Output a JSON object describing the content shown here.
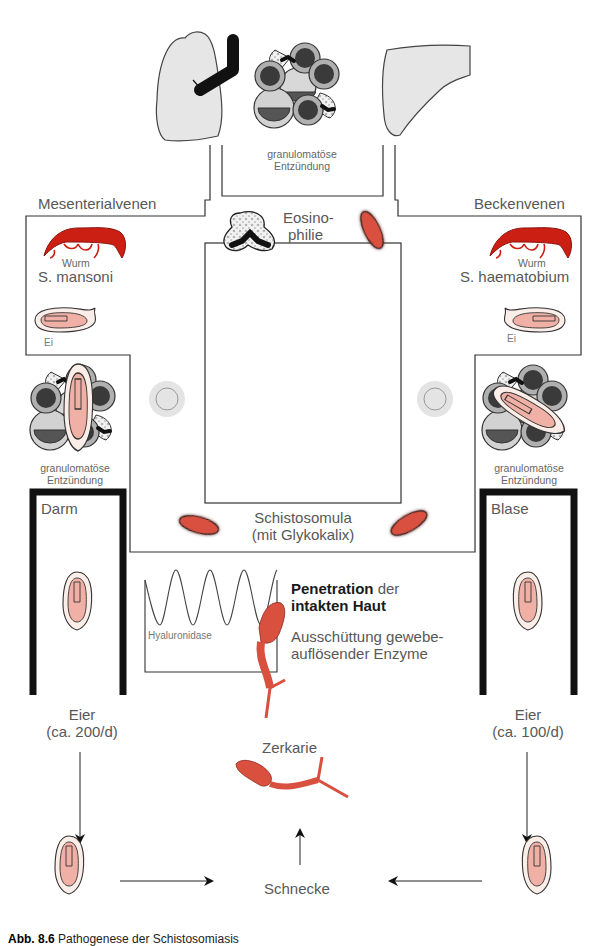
{
  "figure": {
    "caption_number": "Abb. 8.6",
    "caption_text": "Pathogenese der Schistosomiasis"
  },
  "organs": {
    "lung": "lung-icon",
    "liver": "liver-icon",
    "top_granuloma_label_line1": "granulomatöse",
    "top_granuloma_label_line2": "Entzündung"
  },
  "veins": {
    "left_title": "Mesenterialvenen",
    "right_title": "Beckenvenen"
  },
  "left_species": {
    "worm_label": "Wurm",
    "species_name": "S. mansoni",
    "egg_label": "Ei",
    "granuloma_line1": "granulomatöse",
    "granuloma_line2": "Entzündung",
    "organ_label": "Darm",
    "eggs_line1": "Eier",
    "eggs_line2": "(ca. 200/d)"
  },
  "right_species": {
    "worm_label": "Wurm",
    "species_name": "S. haematobium",
    "egg_label": "Ei",
    "granuloma_line1": "granulomatöse",
    "granuloma_line2": "Entzündung",
    "organ_label": "Blase",
    "eggs_line1": "Eier",
    "eggs_line2": "(ca. 100/d)"
  },
  "center": {
    "eosinophilia_line1": "Eosino-",
    "eosinophilia_line2": "philie",
    "schistosomula_line1": "Schistosomula",
    "schistosomula_line2": "(mit Glykokalix)"
  },
  "skin": {
    "enzyme_label": "Hyaluronidase",
    "penetration_bold": "Penetration",
    "penetration_rest": " der",
    "intact_skin_bold": "intakten Haut",
    "enzyme_line1": "Ausschüttung gewebe-",
    "enzyme_line2": "auflösender Enzyme"
  },
  "lifecycle": {
    "cercaria_label": "Zerkarie",
    "snail_label": "Schnecke"
  },
  "colors": {
    "worm_red": "#cc1f14",
    "parasite_red": "#d9503f",
    "egg_pink": "#f0b8ae",
    "egg_shell": "#fbeee9",
    "cell_gray": "#c8c8c8",
    "nucleus_dark": "#3a3a3a",
    "organ_gray": "#e6e6e6"
  }
}
